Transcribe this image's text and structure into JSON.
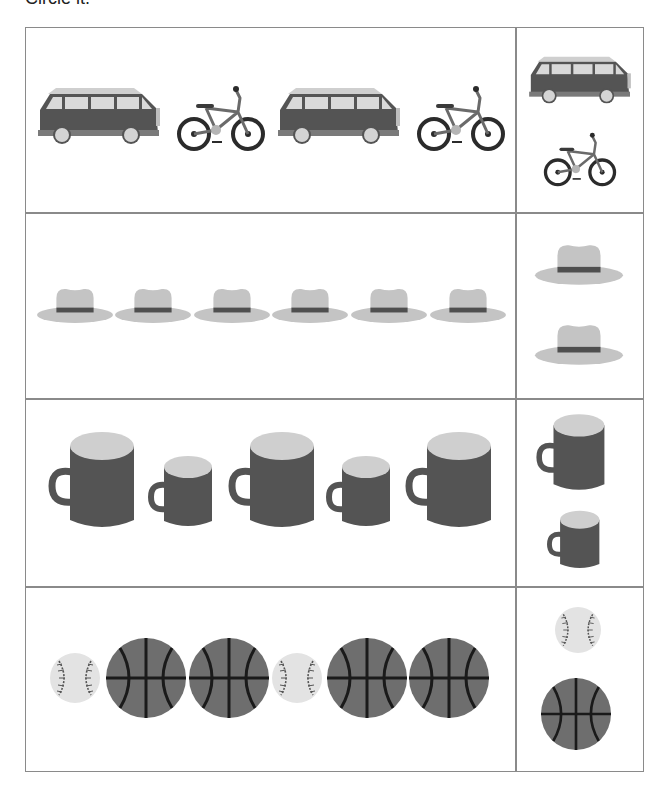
{
  "header": {
    "instruction": "Circle it."
  },
  "colors": {
    "dark": "#545454",
    "light": "#cfcfcf",
    "hat": "#c4c4c4",
    "hat_band": "#4f4f4f",
    "ball_dark": "#6e6e6e",
    "baseball": "#e3e3e3",
    "border": "#8a8a8a"
  },
  "rows": [
    {
      "name": "vehicles",
      "sequence": [
        "van-icon",
        "bicycle-icon",
        "van-icon",
        "bicycle-icon"
      ],
      "choices": [
        "van-icon",
        "bicycle-icon"
      ]
    },
    {
      "name": "hats",
      "sequence": [
        "hat-icon",
        "hat-icon",
        "hat-icon",
        "hat-icon",
        "hat-icon",
        "hat-icon"
      ],
      "choices": [
        "hat-icon",
        "hat-icon"
      ]
    },
    {
      "name": "mugs",
      "sequence": [
        "big-mug-icon",
        "small-mug-icon",
        "big-mug-icon",
        "small-mug-icon",
        "big-mug-icon"
      ],
      "choices": [
        "big-mug-icon",
        "small-mug-icon"
      ]
    },
    {
      "name": "balls",
      "sequence": [
        "baseball-icon",
        "basketball-icon",
        "basketball-icon",
        "baseball-icon",
        "basketball-icon",
        "basketball-icon"
      ],
      "choices": [
        "baseball-icon",
        "basketball-icon"
      ]
    }
  ]
}
